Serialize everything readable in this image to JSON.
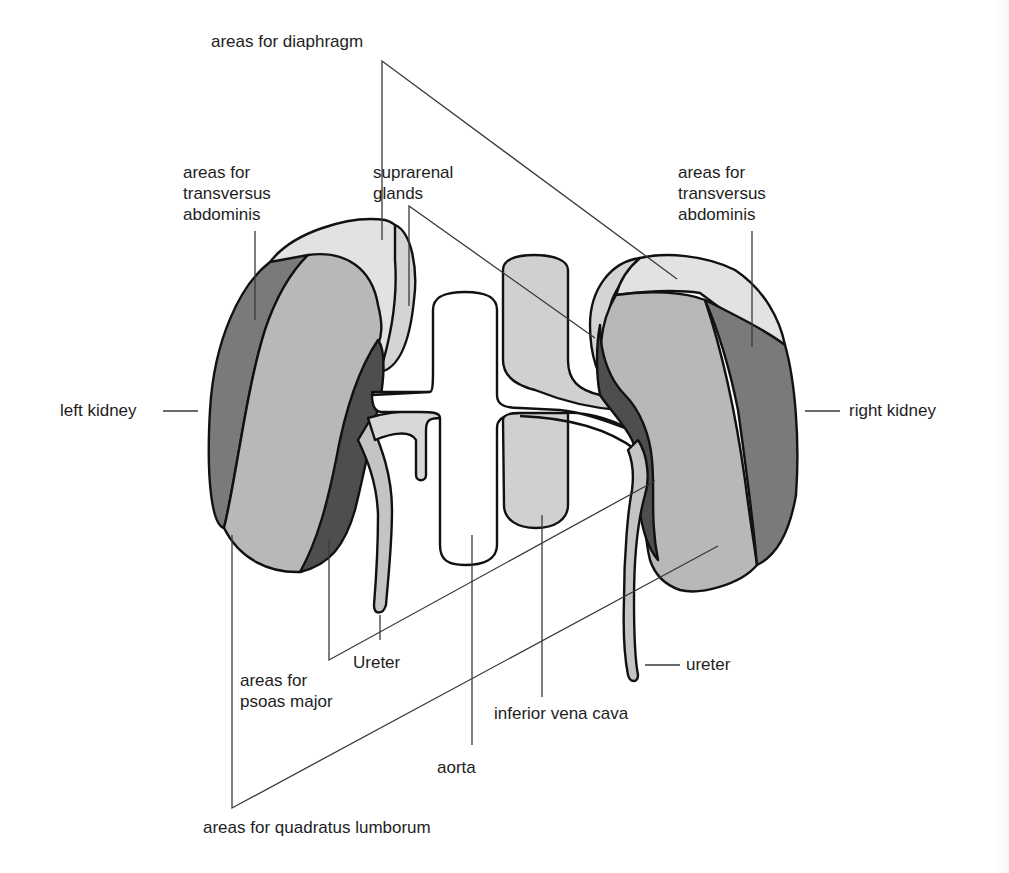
{
  "diagram": {
    "colors": {
      "background": "#ffffff",
      "outline": "#111111",
      "leader_line": "#3a3a3a",
      "label_text": "#1e1e1e",
      "diaphragm_area": "#e2e2e2",
      "quadratus_lumborum_area": "#b8b8b8",
      "transversus_abdominis_area": "#7a7a7a",
      "psoas_major_area": "#4e4e4e",
      "suprarenal_gland": "#d4d4d4",
      "inferior_vena_cava": "#d0d0d0",
      "aorta": "#ffffff",
      "ureter": "#c4c4c4"
    },
    "labels": {
      "diaphragm": "areas for diaphragm",
      "transversus_left": [
        "areas for",
        "transversus",
        "abdominis"
      ],
      "suprarenal": [
        "suprarenal",
        "glands"
      ],
      "transversus_right": [
        "areas for",
        "transversus",
        "abdominis"
      ],
      "left_kidney": "left kidney",
      "right_kidney": "right kidney",
      "ureter_left": "Ureter",
      "ureter_right": "ureter",
      "psoas": [
        "areas for",
        "psoas major"
      ],
      "ivc": "inferior vena cava",
      "aorta": "aorta",
      "quadratus": "areas for quadratus lumborum"
    }
  }
}
